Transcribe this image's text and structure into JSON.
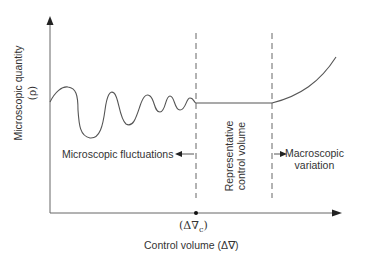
{
  "diagram": {
    "y_axis_label": "Microscopic quantity",
    "y_axis_symbol": "(ρ)",
    "x_axis_label": "Control volume (Δ∇)",
    "x_marker_label": "(Δ∇",
    "x_marker_subscript": "c",
    "x_marker_close": ")",
    "regions": {
      "left": "Microscopic fluctuations",
      "middle_line1": "Representative",
      "middle_line2": "control volume",
      "right_line1": "Macroscopic",
      "right_line2": "variation"
    },
    "colors": {
      "line": "#555555",
      "axis": "#555555",
      "text": "#333333"
    }
  }
}
